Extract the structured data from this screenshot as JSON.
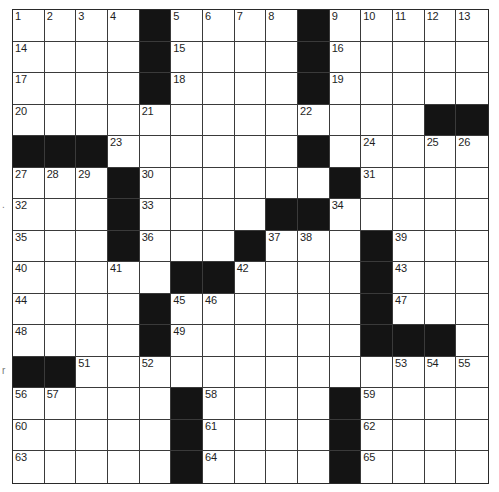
{
  "puzzle": {
    "rows": 15,
    "cols": 15,
    "colors": {
      "block": "#141414",
      "cell": "#ffffff",
      "line": "#3a3a3a",
      "number": "#1e1e1e"
    },
    "layout": [
      "....#....#.....",
      "....#....#.....",
      "....#....#.....",
      ".............##",
      "###......#.....",
      "...#......#....",
      "...#....##.....",
      "...#...#...#...",
      ".....##....#...",
      "....#......#...",
      "....#......###.",
      "##.............",
      ".....#....#....",
      ".....#....#....",
      ".....#....#...."
    ],
    "numbers": [
      {
        "r": 0,
        "c": 0,
        "n": "1"
      },
      {
        "r": 0,
        "c": 1,
        "n": "2"
      },
      {
        "r": 0,
        "c": 2,
        "n": "3"
      },
      {
        "r": 0,
        "c": 3,
        "n": "4"
      },
      {
        "r": 0,
        "c": 5,
        "n": "5"
      },
      {
        "r": 0,
        "c": 6,
        "n": "6"
      },
      {
        "r": 0,
        "c": 7,
        "n": "7"
      },
      {
        "r": 0,
        "c": 8,
        "n": "8"
      },
      {
        "r": 0,
        "c": 10,
        "n": "9"
      },
      {
        "r": 0,
        "c": 11,
        "n": "10"
      },
      {
        "r": 0,
        "c": 12,
        "n": "11"
      },
      {
        "r": 0,
        "c": 13,
        "n": "12"
      },
      {
        "r": 0,
        "c": 14,
        "n": "13"
      },
      {
        "r": 1,
        "c": 0,
        "n": "14"
      },
      {
        "r": 1,
        "c": 5,
        "n": "15"
      },
      {
        "r": 1,
        "c": 10,
        "n": "16"
      },
      {
        "r": 2,
        "c": 0,
        "n": "17"
      },
      {
        "r": 2,
        "c": 5,
        "n": "18"
      },
      {
        "r": 2,
        "c": 10,
        "n": "19"
      },
      {
        "r": 3,
        "c": 0,
        "n": "20"
      },
      {
        "r": 3,
        "c": 4,
        "n": "21"
      },
      {
        "r": 3,
        "c": 9,
        "n": "22"
      },
      {
        "r": 4,
        "c": 3,
        "n": "23"
      },
      {
        "r": 4,
        "c": 11,
        "n": "24"
      },
      {
        "r": 4,
        "c": 13,
        "n": "25"
      },
      {
        "r": 4,
        "c": 14,
        "n": "26"
      },
      {
        "r": 5,
        "c": 0,
        "n": "27"
      },
      {
        "r": 5,
        "c": 1,
        "n": "28"
      },
      {
        "r": 5,
        "c": 2,
        "n": "29"
      },
      {
        "r": 5,
        "c": 4,
        "n": "30"
      },
      {
        "r": 5,
        "c": 11,
        "n": "31"
      },
      {
        "r": 6,
        "c": 0,
        "n": "32"
      },
      {
        "r": 6,
        "c": 4,
        "n": "33"
      },
      {
        "r": 6,
        "c": 10,
        "n": "34"
      },
      {
        "r": 7,
        "c": 0,
        "n": "35"
      },
      {
        "r": 7,
        "c": 4,
        "n": "36"
      },
      {
        "r": 7,
        "c": 8,
        "n": "37"
      },
      {
        "r": 7,
        "c": 9,
        "n": "38"
      },
      {
        "r": 7,
        "c": 12,
        "n": "39"
      },
      {
        "r": 8,
        "c": 0,
        "n": "40"
      },
      {
        "r": 8,
        "c": 3,
        "n": "41"
      },
      {
        "r": 8,
        "c": 7,
        "n": "42"
      },
      {
        "r": 8,
        "c": 12,
        "n": "43"
      },
      {
        "r": 9,
        "c": 0,
        "n": "44"
      },
      {
        "r": 9,
        "c": 5,
        "n": "45"
      },
      {
        "r": 9,
        "c": 6,
        "n": "46"
      },
      {
        "r": 9,
        "c": 12,
        "n": "47"
      },
      {
        "r": 10,
        "c": 0,
        "n": "48"
      },
      {
        "r": 10,
        "c": 5,
        "n": "49"
      },
      {
        "r": 10,
        "c": 11,
        "n": "50"
      },
      {
        "r": 11,
        "c": 2,
        "n": "51"
      },
      {
        "r": 11,
        "c": 4,
        "n": "52"
      },
      {
        "r": 11,
        "c": 12,
        "n": "53"
      },
      {
        "r": 11,
        "c": 13,
        "n": "54"
      },
      {
        "r": 11,
        "c": 14,
        "n": "55"
      },
      {
        "r": 12,
        "c": 0,
        "n": "56"
      },
      {
        "r": 12,
        "c": 1,
        "n": "57"
      },
      {
        "r": 12,
        "c": 6,
        "n": "58"
      },
      {
        "r": 12,
        "c": 11,
        "n": "59"
      },
      {
        "r": 13,
        "c": 0,
        "n": "60"
      },
      {
        "r": 13,
        "c": 6,
        "n": "61"
      },
      {
        "r": 13,
        "c": 11,
        "n": "62"
      },
      {
        "r": 14,
        "c": 0,
        "n": "63"
      },
      {
        "r": 14,
        "c": 6,
        "n": "64"
      },
      {
        "r": 14,
        "c": 11,
        "n": "65"
      }
    ]
  },
  "margin_marks": {
    "upper": ".",
    "lower": "r"
  }
}
